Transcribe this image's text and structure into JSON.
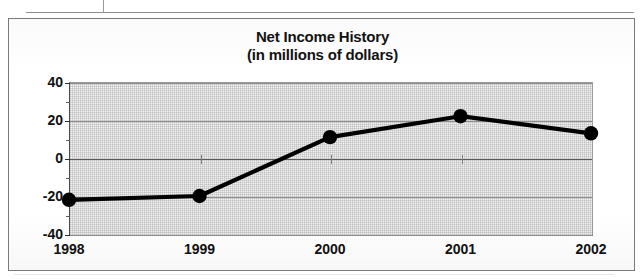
{
  "document": {
    "table_fragment_label": "table-cell-border-fragment"
  },
  "chart": {
    "title_line1": "Net Income History",
    "title_line2": "(in millions of dollars)"
  },
  "chart_data": {
    "type": "line",
    "title": "Net Income History (in millions of dollars)",
    "subtitle": "(in millions of dollars)",
    "xlabel": "",
    "ylabel": "",
    "categories": [
      "1998",
      "1999",
      "2000",
      "2001",
      "2002"
    ],
    "values": [
      -22,
      -20,
      11,
      22,
      13
    ],
    "series": [
      {
        "name": "Net Income",
        "values": [
          -22,
          -20,
          11,
          22,
          13
        ]
      }
    ],
    "ylim": [
      -40,
      40
    ],
    "yticks": [
      40,
      20,
      0,
      -20,
      -40
    ],
    "ytick_labels": [
      "40",
      "20",
      "0",
      "-20",
      "-40"
    ],
    "yminor_ticks": [
      30,
      10,
      -10,
      -30
    ],
    "grid": true,
    "legend": "none",
    "marker": "filled-circle",
    "line_color": "#000000",
    "marker_color": "#000000",
    "plot_background": "#f2f2f2"
  }
}
